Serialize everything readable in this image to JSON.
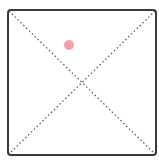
{
  "canvas": {
    "width": 159,
    "height": 167,
    "background": "#ffffff"
  },
  "frame": {
    "x": 8,
    "y": 10,
    "width": 148,
    "height": 145,
    "stroke": "#3a3a3a",
    "stroke_width": 2,
    "radius": 3
  },
  "diagonals": {
    "stroke": "#555555",
    "dash": "1.5 2.5"
  },
  "marker": {
    "cx": 69,
    "cy": 45,
    "r": 5,
    "fill": "#f0a0a8"
  }
}
